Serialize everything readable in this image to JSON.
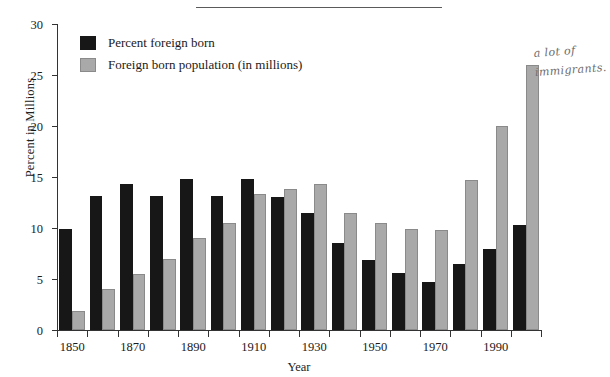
{
  "chart_data": {
    "type": "bar",
    "title": "",
    "xlabel": "Year",
    "ylabel": "Percent in Millions",
    "categories": [
      1850,
      1860,
      1870,
      1880,
      1890,
      1900,
      1910,
      1920,
      1930,
      1940,
      1950,
      1960,
      1970,
      1980,
      1990,
      2000
    ],
    "series": [
      {
        "name": "Percent foreign born",
        "color": "#171717",
        "values": [
          9.9,
          13.1,
          14.3,
          13.1,
          14.8,
          13.1,
          14.8,
          13.0,
          11.5,
          8.5,
          6.9,
          5.6,
          4.7,
          6.5,
          7.9,
          10.3
        ]
      },
      {
        "name": "Foreign born population (in millions)",
        "color": "#a9a9a9",
        "values": [
          1.9,
          4.0,
          5.5,
          7.0,
          9.0,
          10.5,
          13.3,
          13.8,
          14.3,
          11.5,
          10.5,
          9.9,
          9.8,
          14.7,
          20.0,
          26.0
        ]
      }
    ],
    "ylim": [
      0,
      30
    ],
    "yticks": [
      0,
      5,
      10,
      15,
      20,
      25,
      30
    ],
    "xticks_labeled": [
      1850,
      1870,
      1890,
      1910,
      1930,
      1950,
      1970,
      1990
    ],
    "xlim": [
      1850,
      2000
    ],
    "grid": false,
    "legend_position": "top-left"
  },
  "legend": {
    "items": [
      {
        "label": "Percent foreign born",
        "swatch": "dark-square-swatch"
      },
      {
        "label": "Foreign born population (in millions)",
        "swatch": "light-square-swatch"
      }
    ]
  },
  "axes": {
    "y_title": "Percent in Millions",
    "x_title": "Year",
    "y_tick_labels": [
      "0",
      "5",
      "10",
      "15",
      "20",
      "25",
      "30"
    ],
    "x_tick_labels": [
      "1850",
      "1870",
      "1890",
      "1910",
      "1930",
      "1950",
      "1970",
      "1990"
    ]
  },
  "annotation": {
    "line1": "a lot of",
    "line2": "immigrants."
  }
}
